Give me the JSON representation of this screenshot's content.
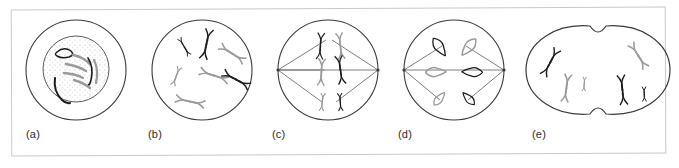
{
  "figure": {
    "caption_labels": [
      "(a)",
      "(b)",
      "(c)",
      "(d)",
      "(e)"
    ],
    "border_color": "#c9c9c9",
    "background_color": "#ffffff",
    "chromosome_dark_color": "#1a1a1a",
    "chromosome_light_color": "#9a9a9a",
    "membrane_color": "#3a3a3a",
    "spindle_color": "#6e6e6e",
    "nucleus_stipple_color": "#b5b5b5"
  },
  "panels": [
    {
      "id": "a",
      "label": "(a)",
      "stage_name": "interphase",
      "description": "Cell with intact nuclear envelope; stippled nucleus containing long uncondensed chromosome threads",
      "has_nucleus": true,
      "has_spindle": false,
      "cell_shape": "circle",
      "chromosome_count": 6,
      "chromosome_form": "thread",
      "dark_chromosomes": 3,
      "light_chromosomes": 3
    },
    {
      "id": "b",
      "label": "(b)",
      "stage_name": "prophase",
      "description": "Nuclear envelope gone; condensed X-shaped chromosomes scattered through the cell",
      "has_nucleus": false,
      "has_spindle": false,
      "cell_shape": "circle",
      "chromosome_count": 7,
      "chromosome_form": "x-shape",
      "dark_chromosomes": 3,
      "light_chromosomes": 4
    },
    {
      "id": "c",
      "label": "(c)",
      "stage_name": "metaphase",
      "description": "Spindle fibres from two opposite poles; chromosomes aligned near the equator",
      "has_nucleus": false,
      "has_spindle": true,
      "cell_shape": "circle",
      "chromosome_count": 6,
      "chromosome_form": "x-shape",
      "dark_chromosomes": 3,
      "light_chromosomes": 3,
      "spindle_poles": 2
    },
    {
      "id": "d",
      "label": "(d)",
      "stage_name": "anaphase",
      "description": "Sister chromatids separated into V shapes moving toward opposite poles",
      "has_nucleus": false,
      "has_spindle": true,
      "cell_shape": "circle",
      "chromosome_count": 6,
      "chromosome_form": "v-shape",
      "dark_chromosomes": 3,
      "light_chromosomes": 3,
      "spindle_poles": 2
    },
    {
      "id": "e",
      "label": "(e)",
      "stage_name": "telophase-cytokinesis",
      "description": "Cell pinching at a cleavage furrow into two daughter cells, each with its own chromosome set",
      "has_nucleus": false,
      "has_spindle": false,
      "cell_shape": "dividing",
      "chromosome_count": 6,
      "chromosome_form": "v-shape",
      "dark_chromosomes": 3,
      "light_chromosomes": 3
    }
  ]
}
